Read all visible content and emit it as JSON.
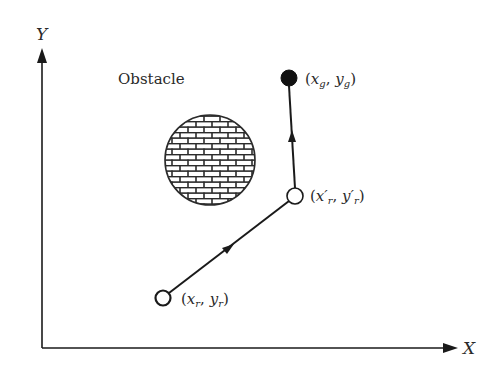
{
  "diagram": {
    "axes": {
      "x_label": "X",
      "y_label": "Y"
    },
    "obstacle": {
      "label": "Obstacle",
      "pattern": "brick"
    },
    "points": {
      "start": {
        "label_x": "x",
        "label_x_sub": "r",
        "label_y": "y",
        "label_y_sub": "r",
        "style": "open"
      },
      "waypoint": {
        "label_x": "x′",
        "label_x_sub": "r",
        "label_y": "y′",
        "label_y_sub": "r",
        "style": "open"
      },
      "goal": {
        "label_x": "x",
        "label_x_sub": "g",
        "label_y": "y",
        "label_y_sub": "g",
        "style": "filled"
      }
    },
    "path": [
      "start",
      "waypoint",
      "goal"
    ],
    "colors": {
      "line": "#1a1a1a",
      "background": "#ffffff"
    }
  }
}
